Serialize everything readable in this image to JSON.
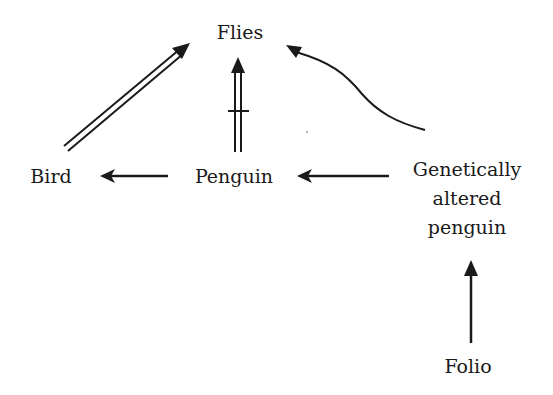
{
  "diagram": {
    "type": "inheritance-network",
    "nodes": [
      {
        "id": "flies",
        "label": "Flies"
      },
      {
        "id": "bird",
        "label": "Bird"
      },
      {
        "id": "penguin",
        "label": "Penguin"
      },
      {
        "id": "gap",
        "label_lines": [
          "Genetically",
          "altered",
          "penguin"
        ]
      },
      {
        "id": "folio",
        "label": "Folio"
      }
    ],
    "edges": [
      {
        "from": "bird",
        "to": "flies",
        "style": "double-arrow",
        "meaning": "default is-a"
      },
      {
        "from": "penguin",
        "to": "flies",
        "style": "double-arrow-crossed",
        "meaning": "default is-not"
      },
      {
        "from": "penguin",
        "to": "bird",
        "style": "single-arrow",
        "meaning": "strict is-a"
      },
      {
        "from": "gap",
        "to": "penguin",
        "style": "single-arrow",
        "meaning": "strict is-a"
      },
      {
        "from": "gap",
        "to": "flies",
        "style": "curved-arrow",
        "meaning": "is-a"
      },
      {
        "from": "folio",
        "to": "gap",
        "style": "single-arrow",
        "meaning": "strict is-a"
      }
    ],
    "colors": {
      "ink": "#1a1a1a",
      "background": "#ffffff"
    }
  }
}
